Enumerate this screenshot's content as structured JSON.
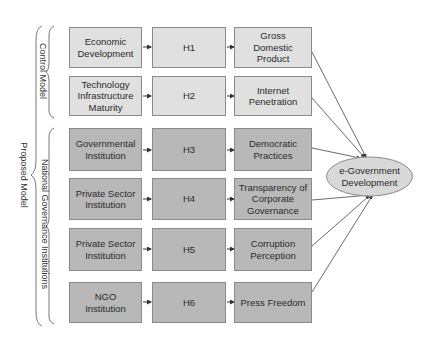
{
  "diagram": {
    "side_labels": {
      "proposed_model": "Proposed Model",
      "control_model": "Control Model",
      "national_governance": "National Governance Institutions"
    },
    "rows": [
      {
        "group": "control",
        "source": "Economic\nDevelopment",
        "hypothesis": "H1",
        "indicator": "Gross\nDomestic\nProduct"
      },
      {
        "group": "control",
        "source": "Technology\nInfrastructure\nMaturity",
        "hypothesis": "H2",
        "indicator": "Internet\nPenetration"
      },
      {
        "group": "governance",
        "source": "Governmental\nInstitution",
        "hypothesis": "H3",
        "indicator": "Democratic\nPractices"
      },
      {
        "group": "governance",
        "source": "Private Sector\nInstitution",
        "hypothesis": "H4",
        "indicator": "Transparency of\nCorporate\nGovernance"
      },
      {
        "group": "governance",
        "source": "Private Sector\nInstitution",
        "hypothesis": "H5",
        "indicator": "Corruption\nPerception"
      },
      {
        "group": "governance",
        "source": "NGO\nInstitution",
        "hypothesis": "H6",
        "indicator": "Press Freedom"
      }
    ],
    "outcome": "e-Government\nDevelopment",
    "colors": {
      "control_fill": "#e0e0e0",
      "governance_fill": "#b8b8b8",
      "outcome_fill": "#d8d8d8",
      "border": "#8a8a8a"
    }
  }
}
